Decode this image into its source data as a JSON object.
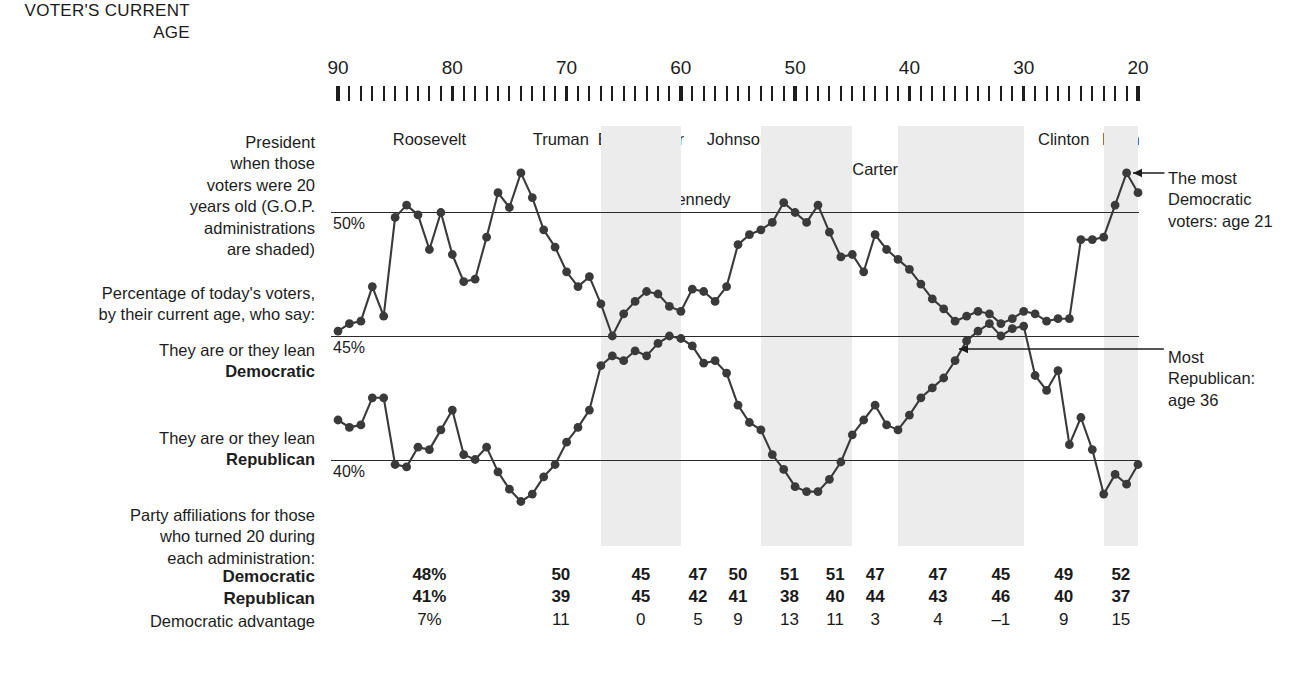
{
  "axis_header": "VOTER'S\nCURRENT\nAGE",
  "left_labels": {
    "president_note": "President\nwhen those\nvoters were 20\nyears old (G.O.P.\nadministrations\nare shaded)",
    "percentage_note": "Percentage of today's voters,\nby their current age, who say:",
    "dem_lead_in": "They are or they lean",
    "dem_word": "Democratic",
    "rep_lead_in": "They are or they lean",
    "rep_word": "Republican",
    "party_note": "Party affiliations for those\nwho turned 20 during\neach administration:",
    "row_dem": "Democratic",
    "row_rep": "Republican",
    "row_adv": "Democratic advantage"
  },
  "annotations": {
    "most_democratic": "The most\nDemocratic\nvoters: age 21",
    "most_republican": "Most\nRepublican:\nage 36"
  },
  "chart_data": {
    "type": "line",
    "xlabel": "Voter's current age",
    "ylabel": "Percentage",
    "xlim": [
      90,
      20
    ],
    "ylim": [
      36.5,
      53.5
    ],
    "grid": true,
    "gridlines": [
      {
        "value": 50,
        "label": "50%"
      },
      {
        "value": 45,
        "label": "45%"
      },
      {
        "value": 40,
        "label": "40%"
      }
    ],
    "xticks": [
      90,
      80,
      70,
      60,
      50,
      40,
      30,
      20
    ],
    "minor_tick_step": 1,
    "legend": [
      "Democratic",
      "Republican"
    ],
    "x": [
      90,
      89,
      88,
      87,
      86,
      85,
      84,
      83,
      82,
      81,
      80,
      79,
      78,
      77,
      76,
      75,
      74,
      73,
      72,
      71,
      70,
      69,
      68,
      67,
      66,
      65,
      64,
      63,
      62,
      61,
      60,
      59,
      58,
      57,
      56,
      55,
      54,
      53,
      52,
      51,
      50,
      49,
      48,
      47,
      46,
      45,
      44,
      43,
      42,
      41,
      40,
      39,
      38,
      37,
      36,
      35,
      34,
      33,
      32,
      31,
      30,
      29,
      28,
      27,
      26,
      25,
      24,
      23,
      22,
      21,
      20
    ],
    "series": [
      {
        "name": "Democratic",
        "values": [
          45.2,
          45.5,
          45.6,
          47.0,
          45.8,
          49.8,
          50.3,
          49.9,
          48.5,
          50.0,
          48.3,
          47.2,
          47.3,
          49.0,
          50.8,
          50.2,
          51.6,
          50.6,
          49.3,
          48.6,
          47.6,
          47.0,
          47.4,
          46.3,
          45.0,
          45.9,
          46.4,
          46.8,
          46.7,
          46.2,
          46.0,
          46.9,
          46.8,
          46.4,
          47.0,
          48.7,
          49.1,
          49.3,
          49.6,
          50.4,
          50.0,
          49.6,
          50.3,
          49.2,
          48.2,
          48.3,
          47.6,
          49.1,
          48.5,
          48.1,
          47.7,
          47.1,
          46.5,
          46.1,
          45.6,
          45.8,
          46.0,
          45.9,
          45.5,
          45.7,
          46.0,
          45.9,
          45.6,
          45.7,
          45.7,
          48.9,
          48.9,
          49.0,
          50.3,
          51.6,
          50.8
        ]
      },
      {
        "name": "Republican",
        "values": [
          41.6,
          41.3,
          41.4,
          42.5,
          42.5,
          39.8,
          39.7,
          40.5,
          40.4,
          41.2,
          42.0,
          40.2,
          40.0,
          40.5,
          39.5,
          38.8,
          38.3,
          38.6,
          39.3,
          39.8,
          40.7,
          41.3,
          42.0,
          43.8,
          44.2,
          44.0,
          44.4,
          44.2,
          44.7,
          45.0,
          44.9,
          44.6,
          43.9,
          44.0,
          43.5,
          42.2,
          41.5,
          41.2,
          40.2,
          39.6,
          38.9,
          38.7,
          38.7,
          39.2,
          39.9,
          41.0,
          41.6,
          42.2,
          41.4,
          41.2,
          41.8,
          42.5,
          42.9,
          43.3,
          44.0,
          44.8,
          45.2,
          45.5,
          45.0,
          45.3,
          45.4,
          43.4,
          42.8,
          43.6,
          40.6,
          41.7,
          40.4,
          38.6,
          39.4,
          39.0,
          39.8
        ]
      }
    ],
    "callouts": [
      {
        "text": "The most Democratic voters: age 21",
        "age": 21,
        "series": "Democratic"
      },
      {
        "text": "Most Republican: age 36",
        "age": 36,
        "series": "Republican"
      }
    ]
  },
  "presidents": [
    {
      "name": "Roosevelt",
      "start_age": 90,
      "end_age": 74,
      "gop": false
    },
    {
      "name": "Truman",
      "start_age": 74,
      "end_age": 67,
      "gop": false
    },
    {
      "name": "Eisenhower",
      "start_age": 67,
      "end_age": 60,
      "gop": true
    },
    {
      "name": "Kennedy",
      "start_age": 60,
      "end_age": 57,
      "gop": false
    },
    {
      "name": "Johnson",
      "start_age": 57,
      "end_age": 53,
      "gop": false
    },
    {
      "name": "Nixon",
      "start_age": 53,
      "end_age": 48,
      "gop": true
    },
    {
      "name": "Ford",
      "start_age": 48,
      "end_age": 45,
      "gop": true
    },
    {
      "name": "Carter",
      "start_age": 45,
      "end_age": 41,
      "gop": false
    },
    {
      "name": "Reagan",
      "start_age": 41,
      "end_age": 34,
      "gop": true
    },
    {
      "name": "Bush",
      "start_age": 34,
      "end_age": 30,
      "gop": true
    },
    {
      "name": "Clinton",
      "start_age": 30,
      "end_age": 23,
      "gop": false
    },
    {
      "name": "Bush",
      "start_age": 23,
      "end_age": 20,
      "gop": true
    }
  ],
  "table": {
    "columns": [
      "Roosevelt",
      "Truman",
      "Eisenhower",
      "Kennedy",
      "Johnson",
      "Nixon",
      "Ford",
      "Carter",
      "Reagan",
      "Bush",
      "Clinton",
      "Bush"
    ],
    "democratic": [
      "48%",
      "50",
      "45",
      "47",
      "50",
      "51",
      "51",
      "47",
      "47",
      "45",
      "49",
      "52"
    ],
    "republican": [
      "41%",
      "39",
      "45",
      "42",
      "41",
      "38",
      "40",
      "44",
      "43",
      "46",
      "40",
      "37"
    ],
    "advantage": [
      "7%",
      "11",
      "0",
      "5",
      "9",
      "13",
      "11",
      "3",
      "4",
      "–1",
      "9",
      "15"
    ]
  },
  "colors": {
    "ink": "#1d1d1d",
    "shade": "#ececec",
    "line": "#3a3a3a",
    "marker": "#3a3a3a"
  }
}
